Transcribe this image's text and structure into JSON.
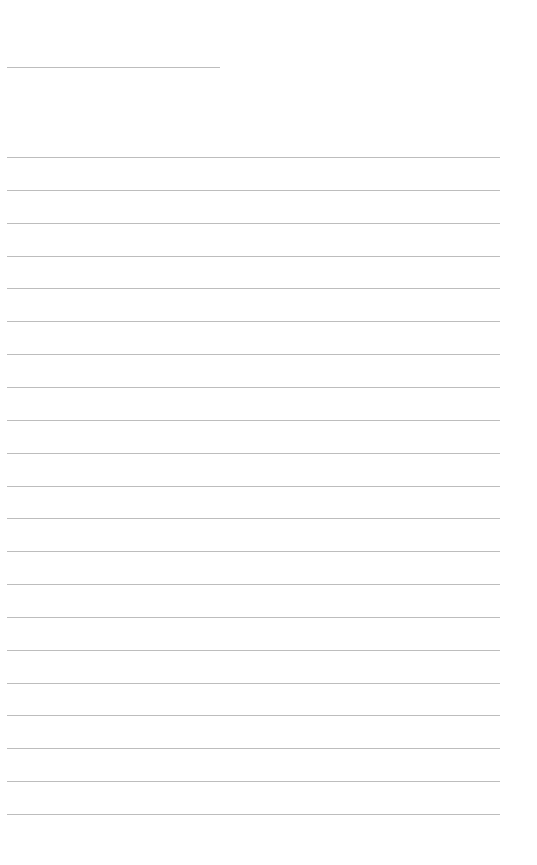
{
  "page": {
    "background": "#ffffff",
    "rule_color": "#bdbdbd"
  },
  "title_line": {
    "x": 7,
    "y": 67,
    "width": 213
  },
  "ruled_lines": {
    "x": 7,
    "width": 493,
    "start_y": 157,
    "spacing": 32.85,
    "count": 21
  }
}
